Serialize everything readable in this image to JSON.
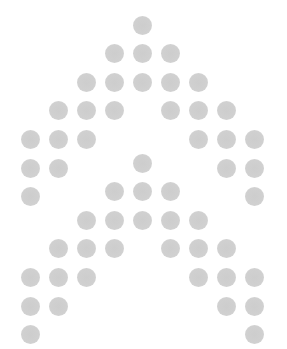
{
  "pattern": {
    "dot_color": "#cfcfcf",
    "background": "#ffffff",
    "dot_diameter": 19,
    "column_x": [
      30,
      58,
      86,
      114,
      142,
      170,
      198,
      226,
      254
    ],
    "row_spacing": 28.6,
    "chevrons": [
      {
        "name": "upper-chevron",
        "top_y": 25
      },
      {
        "name": "lower-chevron",
        "top_y": 163
      }
    ],
    "rows": [
      [
        4
      ],
      [
        3,
        4,
        5
      ],
      [
        2,
        3,
        4,
        5,
        6
      ],
      [
        1,
        2,
        3,
        5,
        6,
        7
      ],
      [
        0,
        1,
        2,
        6,
        7,
        8
      ],
      [
        0,
        1,
        7,
        8
      ],
      [
        0,
        8
      ]
    ]
  }
}
